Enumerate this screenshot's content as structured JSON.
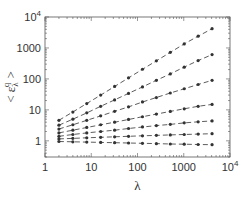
{
  "chart_data": {
    "type": "line",
    "title": "",
    "xlabel": "λ",
    "ylabel": "< ε_λ^q >",
    "xscale": "log",
    "yscale": "log",
    "xlim": [
      1,
      10000
    ],
    "ylim": [
      0.3,
      10000
    ],
    "x_tick_labels": [
      "1",
      "10",
      "100",
      "1000",
      "10^4"
    ],
    "y_tick_labels": [
      "1",
      "10",
      "100",
      "1000",
      "10^4"
    ],
    "grid": false,
    "legend": null,
    "x": [
      2,
      4,
      8,
      16,
      32,
      64,
      128,
      256,
      512,
      1024,
      2048,
      4096
    ],
    "series": [
      {
        "name": "series-1",
        "values": [
          4.6,
          8.5,
          16,
          30,
          57,
          108,
          205,
          385,
          720,
          1350,
          2400,
          4200
        ]
      },
      {
        "name": "series-2",
        "values": [
          3.2,
          5.0,
          8.0,
          13,
          21,
          34,
          55,
          90,
          145,
          240,
          390,
          610
        ]
      },
      {
        "name": "series-3",
        "values": [
          2.4,
          3.3,
          4.6,
          6.4,
          9.0,
          12.5,
          18,
          25,
          35,
          48,
          66,
          90
        ]
      },
      {
        "name": "series-4",
        "values": [
          1.8,
          2.2,
          2.7,
          3.3,
          4.0,
          4.9,
          6.0,
          7.3,
          8.9,
          10.8,
          13,
          15
        ]
      },
      {
        "name": "series-5",
        "values": [
          1.4,
          1.6,
          1.8,
          2.0,
          2.2,
          2.5,
          2.8,
          3.1,
          3.4,
          3.8,
          4.1,
          4.4
        ]
      },
      {
        "name": "series-6",
        "values": [
          1.15,
          1.2,
          1.25,
          1.3,
          1.35,
          1.4,
          1.45,
          1.5,
          1.55,
          1.6,
          1.65,
          1.7
        ]
      },
      {
        "name": "series-7",
        "values": [
          0.95,
          0.93,
          0.91,
          0.89,
          0.87,
          0.85,
          0.83,
          0.81,
          0.79,
          0.78,
          0.76,
          0.75
        ]
      }
    ],
    "marker": "filled-circle",
    "line_style": "dashed",
    "color": "#333333"
  }
}
